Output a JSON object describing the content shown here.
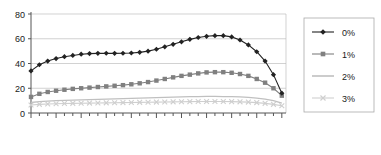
{
  "chart_data": {
    "type": "line",
    "title": "",
    "subtitle": "",
    "xlabel": "",
    "ylabel": "",
    "xlim": [
      1995,
      2300
    ],
    "ylim": [
      0,
      80
    ],
    "yticks": [
      0,
      20,
      40,
      60,
      80
    ],
    "xticks": [
      1995,
      2025,
      2055,
      2085,
      2115,
      2145,
      2175,
      2205,
      2235,
      2265,
      2295
    ],
    "xtick_labels": [
      "1995",
      "2025",
      "2055",
      "2085",
      "2115",
      "2145",
      "2175",
      "2205",
      "2235",
      "2265",
      "2295"
    ],
    "ytick_labels": [
      "0",
      "20",
      "40",
      "60",
      "80"
    ],
    "minor_xtick_step": 10,
    "grid": "horizontal",
    "legend_position": "right",
    "x": [
      1995,
      2005,
      2015,
      2025,
      2035,
      2045,
      2055,
      2065,
      2075,
      2085,
      2095,
      2105,
      2115,
      2125,
      2135,
      2145,
      2155,
      2165,
      2175,
      2185,
      2195,
      2205,
      2215,
      2225,
      2235,
      2245,
      2255,
      2265,
      2275,
      2285,
      2295
    ],
    "series": [
      {
        "name": "0%",
        "marker": "diamond",
        "color": "#222222",
        "values": [
          34,
          39,
          42,
          44,
          45.5,
          46.5,
          47.5,
          48,
          48.2,
          48.3,
          48.2,
          48.3,
          48.5,
          49,
          50,
          51.5,
          53.5,
          55.5,
          57.5,
          59.5,
          61,
          62,
          62.5,
          62.5,
          61.5,
          59,
          55,
          49.5,
          42,
          31,
          16
        ]
      },
      {
        "name": "1%",
        "marker": "square",
        "color": "#808080",
        "values": [
          13,
          15.5,
          17,
          18,
          18.8,
          19.5,
          20,
          20.5,
          21,
          21.5,
          22,
          22.5,
          23.2,
          24,
          25,
          26.2,
          27.5,
          28.8,
          30,
          31,
          32,
          32.8,
          33,
          33,
          32.5,
          31.5,
          30,
          27.5,
          24.5,
          20,
          14
        ]
      },
      {
        "name": "2%",
        "marker": "none",
        "color": "#c0c0c0",
        "values": [
          8.5,
          9.2,
          9.6,
          10,
          10.2,
          10.4,
          10.6,
          10.8,
          11,
          11.2,
          11.4,
          11.6,
          11.8,
          12,
          12.2,
          12.4,
          12.6,
          12.8,
          13,
          13.2,
          13.3,
          13.4,
          13.4,
          13.3,
          13.2,
          13,
          12.6,
          12,
          11.2,
          10,
          8
        ]
      },
      {
        "name": "3%",
        "marker": "x",
        "color": "#cfcfcf",
        "values": [
          6.5,
          7,
          7.3,
          7.5,
          7.7,
          7.8,
          7.9,
          8,
          8.1,
          8.2,
          8.3,
          8.4,
          8.5,
          8.6,
          8.7,
          8.8,
          8.9,
          9,
          9.1,
          9.2,
          9.25,
          9.3,
          9.3,
          9.25,
          9.2,
          9,
          8.8,
          8.4,
          7.8,
          7,
          5.8
        ]
      }
    ],
    "legend": [
      {
        "label": "0%",
        "marker": "diamond",
        "color": "#222222"
      },
      {
        "label": "1%",
        "marker": "square",
        "color": "#808080"
      },
      {
        "label": "2%",
        "marker": "none",
        "color": "#c0c0c0"
      },
      {
        "label": "3%",
        "marker": "x",
        "color": "#cfcfcf"
      }
    ],
    "colors": {
      "axis": "#555555",
      "grid": "#bfbfbf",
      "legend_border": "#aaaaaa",
      "text": "#1a1a1a",
      "background": "#ffffff"
    }
  }
}
